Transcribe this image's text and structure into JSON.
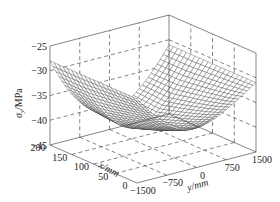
{
  "chart_data": {
    "type": "surface3d",
    "title": "",
    "xlabel": "x/mm",
    "ylabel": "y/mm",
    "zlabel": "σy/MPa",
    "zlabel_parts": {
      "sym": "σ",
      "sub": "y",
      "unit": "/MPa"
    },
    "x_ticks": [
      0,
      50,
      100,
      150,
      200
    ],
    "y_ticks": [
      -1500,
      -750,
      0,
      750,
      1500
    ],
    "z_ticks": [
      -25,
      -30,
      -35,
      -40,
      -45
    ],
    "xlim": [
      0,
      200
    ],
    "ylim": [
      -1500,
      1500
    ],
    "zlim": [
      -45,
      -25
    ],
    "grid": "dashed",
    "surface": {
      "description": "Saddle/bowl-shaped wireframe surface; minimum near x=200,y=0 (~-44 MPa), rising to ~-28 MPa at the y=±1500 edges and ~-25 at back corner",
      "z_min": -44,
      "z_edge_left": -28,
      "z_edge_right": -31,
      "z_back_center": -26,
      "grid_x": 20,
      "grid_y": 40
    }
  },
  "labels": {
    "x_axis": "x/mm",
    "y_axis": "y/mm",
    "z_sym": "σ",
    "z_sub": "y",
    "z_unit": "/MPa"
  }
}
